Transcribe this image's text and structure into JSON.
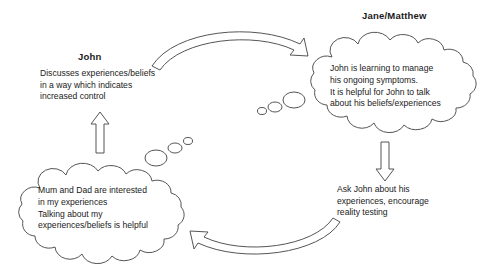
{
  "diagram": {
    "type": "cycle-diagram",
    "background_color": "#ffffff",
    "stroke_color": "#555555",
    "text_color": "#1a1a1a"
  },
  "labels": {
    "john": "John",
    "jane_matthew": "Jane/Matthew"
  },
  "john_behaviour": {
    "lines": [
      "Discusses experiences/beliefs",
      "in a way which indicates",
      "increased control"
    ]
  },
  "carer_action": {
    "lines": [
      "Ask John about his",
      "experiences, encourage",
      "reality testing"
    ]
  },
  "carer_thought": {
    "owner": "Jane/Matthew",
    "lines": [
      "John is learning to manage",
      "his ongoing symptoms.",
      "It is helpful for John to talk",
      "about his beliefs/experiences"
    ]
  },
  "john_thought": {
    "owner": "John",
    "lines": [
      "Mum and Dad are interested",
      "in my experiences",
      "Talking about my",
      "experiences/beliefs is helpful"
    ]
  },
  "arrows": [
    {
      "name": "top-curved-arrow",
      "direction": "left-to-right",
      "from": "john-behaviour",
      "to": "carer-thought"
    },
    {
      "name": "bottom-curved-arrow",
      "direction": "right-to-left",
      "from": "carer-action",
      "to": "john-thought"
    },
    {
      "name": "up-block-arrow",
      "direction": "up",
      "from": "john-thought",
      "to": "john-behaviour"
    },
    {
      "name": "down-block-arrow",
      "direction": "down",
      "from": "carer-thought",
      "to": "carer-action"
    }
  ]
}
